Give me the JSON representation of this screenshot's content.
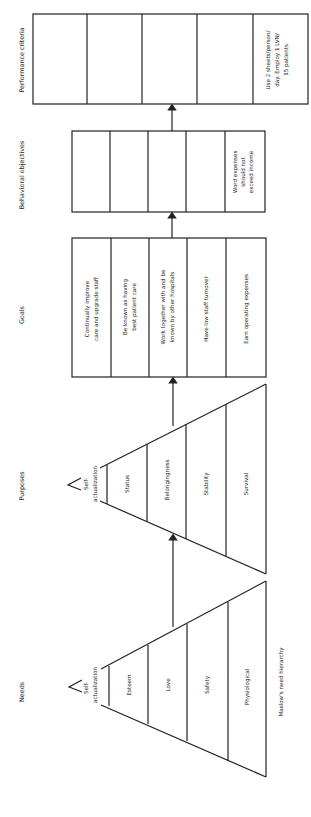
{
  "headers": {
    "needs": "Needs",
    "purposes": "Purposes",
    "goals": "Goals",
    "behavioral": "Behavioral objectives",
    "performance": "Performance criteria"
  },
  "needs_pyramid": {
    "apex": [
      "Self-",
      "actualization"
    ],
    "levels": [
      "Esteem",
      "Love",
      "Safety",
      "Physiological"
    ],
    "caption": "Maslow's need hierarchy"
  },
  "purposes_pyramid": {
    "apex": [
      "Self-",
      "actualization"
    ],
    "levels": [
      "Status",
      "Belongingness",
      "Stability",
      "Survival"
    ]
  },
  "goals": [
    [
      "Continually improve",
      "care and upgrade staff"
    ],
    [
      "Be known as having",
      "best patient care"
    ],
    [
      "Work together with and be",
      "known by other hospitals"
    ],
    [
      "Have low staff turnover"
    ],
    [
      "Earn operating expenses"
    ]
  ],
  "behavioral_objectives": {
    "cells": [
      "",
      "",
      "",
      "",
      ""
    ],
    "last": [
      "Word expenses",
      "should not",
      "exceed income"
    ]
  },
  "performance_criteria": {
    "cells": [
      "",
      "",
      "",
      "",
      ""
    ],
    "last": [
      "Use 2 sheets/person/",
      "day. Employ 1 LVN/",
      "15 patients"
    ]
  }
}
